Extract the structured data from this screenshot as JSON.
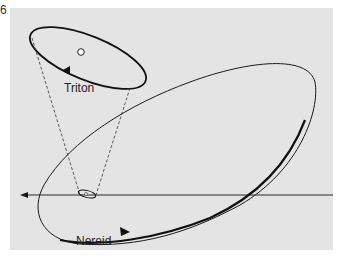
{
  "figure": {
    "number": "6",
    "background_color": "#e4e4e4",
    "line_color": "#1a1a1a"
  },
  "labels": {
    "triton": "Triton",
    "nereid": "Nereid"
  },
  "elements": {
    "triton_orbit": "small tilted ellipse, top-left, arrow on lower edge",
    "planet": "white dot inside Triton orbit (Neptune)",
    "projection_cone": "dashed lines from Triton orbit down to small ellipse on reference line",
    "nereid_orbit": "large eccentric tilted ellipse, thick arrowed lower arc",
    "reference_line": "horizontal line with leftward arrow"
  }
}
